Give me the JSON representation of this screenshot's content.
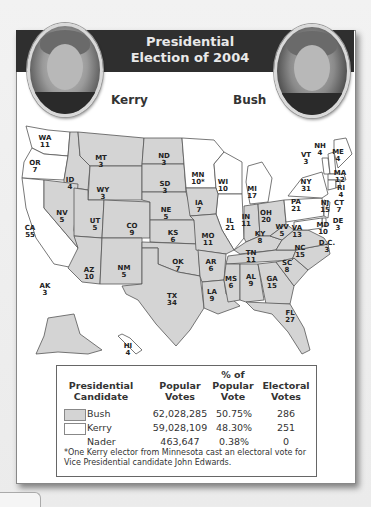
{
  "title": {
    "line1": "Presidential",
    "line2": "Election of 2004"
  },
  "candidates": {
    "left": {
      "name": "Kerry",
      "portrait": "kerry-portrait"
    },
    "right": {
      "name": "Bush",
      "portrait": "bush-portrait"
    }
  },
  "colors": {
    "header_band": "#2f2f2f",
    "bush_fill": "#d4d4d4",
    "kerry_fill": "#ffffff",
    "border": "#555555"
  },
  "map": {
    "states": [
      {
        "abbr": "WA",
        "votes": "11",
        "winner": "Kerry"
      },
      {
        "abbr": "OR",
        "votes": "7",
        "winner": "Kerry"
      },
      {
        "abbr": "CA",
        "votes": "55",
        "winner": "Kerry"
      },
      {
        "abbr": "ID",
        "votes": "4",
        "winner": "Bush"
      },
      {
        "abbr": "NV",
        "votes": "5",
        "winner": "Bush"
      },
      {
        "abbr": "MT",
        "votes": "3",
        "winner": "Bush"
      },
      {
        "abbr": "WY",
        "votes": "3",
        "winner": "Bush"
      },
      {
        "abbr": "UT",
        "votes": "5",
        "winner": "Bush"
      },
      {
        "abbr": "CO",
        "votes": "9",
        "winner": "Bush"
      },
      {
        "abbr": "AZ",
        "votes": "10",
        "winner": "Bush"
      },
      {
        "abbr": "NM",
        "votes": "5",
        "winner": "Bush"
      },
      {
        "abbr": "ND",
        "votes": "3",
        "winner": "Bush"
      },
      {
        "abbr": "SD",
        "votes": "3",
        "winner": "Bush"
      },
      {
        "abbr": "NE",
        "votes": "5",
        "winner": "Bush"
      },
      {
        "abbr": "KS",
        "votes": "6",
        "winner": "Bush"
      },
      {
        "abbr": "OK",
        "votes": "7",
        "winner": "Bush"
      },
      {
        "abbr": "TX",
        "votes": "34",
        "winner": "Bush"
      },
      {
        "abbr": "MN",
        "votes": "10*",
        "winner": "Kerry"
      },
      {
        "abbr": "IA",
        "votes": "7",
        "winner": "Bush"
      },
      {
        "abbr": "MO",
        "votes": "11",
        "winner": "Bush"
      },
      {
        "abbr": "AR",
        "votes": "6",
        "winner": "Bush"
      },
      {
        "abbr": "LA",
        "votes": "9",
        "winner": "Bush"
      },
      {
        "abbr": "WI",
        "votes": "10",
        "winner": "Kerry"
      },
      {
        "abbr": "IL",
        "votes": "21",
        "winner": "Kerry"
      },
      {
        "abbr": "MI",
        "votes": "17",
        "winner": "Kerry"
      },
      {
        "abbr": "IN",
        "votes": "11",
        "winner": "Bush"
      },
      {
        "abbr": "OH",
        "votes": "20",
        "winner": "Bush"
      },
      {
        "abbr": "KY",
        "votes": "8",
        "winner": "Bush"
      },
      {
        "abbr": "TN",
        "votes": "11",
        "winner": "Bush"
      },
      {
        "abbr": "MS",
        "votes": "6",
        "winner": "Bush"
      },
      {
        "abbr": "AL",
        "votes": "9",
        "winner": "Bush"
      },
      {
        "abbr": "GA",
        "votes": "15",
        "winner": "Bush"
      },
      {
        "abbr": "FL",
        "votes": "27",
        "winner": "Bush"
      },
      {
        "abbr": "SC",
        "votes": "8",
        "winner": "Bush"
      },
      {
        "abbr": "NC",
        "votes": "15",
        "winner": "Bush"
      },
      {
        "abbr": "VA",
        "votes": "13",
        "winner": "Bush"
      },
      {
        "abbr": "WV",
        "votes": "5",
        "winner": "Bush"
      },
      {
        "abbr": "PA",
        "votes": "21",
        "winner": "Kerry"
      },
      {
        "abbr": "NY",
        "votes": "31",
        "winner": "Kerry"
      },
      {
        "abbr": "VT",
        "votes": "3",
        "winner": "Kerry"
      },
      {
        "abbr": "NH",
        "votes": "4",
        "winner": "Kerry"
      },
      {
        "abbr": "ME",
        "votes": "4",
        "winner": "Kerry"
      },
      {
        "abbr": "MA",
        "votes": "12",
        "winner": "Kerry"
      },
      {
        "abbr": "RI",
        "votes": "4",
        "winner": "Kerry"
      },
      {
        "abbr": "CT",
        "votes": "7",
        "winner": "Kerry"
      },
      {
        "abbr": "NJ",
        "votes": "15",
        "winner": "Kerry"
      },
      {
        "abbr": "DE",
        "votes": "3",
        "winner": "Kerry"
      },
      {
        "abbr": "MD",
        "votes": "10",
        "winner": "Kerry"
      },
      {
        "abbr": "D.C.",
        "votes": "3",
        "winner": "Kerry"
      },
      {
        "abbr": "AK",
        "votes": "3",
        "winner": "Bush"
      },
      {
        "abbr": "HI",
        "votes": "4",
        "winner": "Kerry"
      }
    ]
  },
  "legend": {
    "headers": {
      "candidate": "Presidential Candidate",
      "popular": "Popular Votes",
      "percent": "% of Popular Vote",
      "electoral": "Electoral Votes"
    },
    "rows": [
      {
        "name": "Bush",
        "popular": "62,028,285",
        "percent": "50.75%",
        "electoral": "286",
        "swatch": "#d4d4d4"
      },
      {
        "name": "Kerry",
        "popular": "59,028,109",
        "percent": "48.30%",
        "electoral": "251",
        "swatch": "#ffffff"
      },
      {
        "name": "Nader",
        "popular": "463,647",
        "percent": "0.38%",
        "electoral": "0",
        "swatch": null
      }
    ],
    "footnote": "*One Kerry elector from Minnesota cast an electoral vote for Vice Presidential candidate John Edwards."
  }
}
